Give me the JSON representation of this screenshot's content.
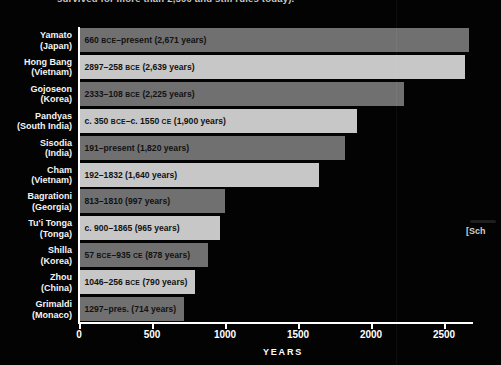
{
  "caption": {
    "fragment": "survived for more than 2,500 and still rules today)."
  },
  "side_text": {
    "fragment": "[Sch"
  },
  "colors": {
    "background": "#030303",
    "bar_dark": "#707070",
    "bar_light": "#c7c7c7",
    "axis": "#ffffff",
    "axis_label_text": "#ffffff",
    "category_label_text": "#f4f4f4",
    "bar_label_text": "#121212"
  },
  "chart_data": {
    "type": "bar",
    "orientation": "horizontal",
    "title": "",
    "xlabel": "YEARS",
    "ylabel": "",
    "x_ticks": [
      0,
      500,
      1000,
      1500,
      2000,
      2500
    ],
    "xlim": [
      0,
      2770
    ],
    "grid": false,
    "legend": "none",
    "bars": [
      {
        "dynasty": "Yamato",
        "country": "(Japan)",
        "label": "660 BCE–present (2,671 years)",
        "years": 2671,
        "shade": "dark"
      },
      {
        "dynasty": "Hong Bang",
        "country": "(Vietnam)",
        "label": "2897–258 BCE (2,639 years)",
        "years": 2639,
        "shade": "light"
      },
      {
        "dynasty": "Gojoseon",
        "country": "(Korea)",
        "label": "2333–108 BCE (2,225 years)",
        "years": 2225,
        "shade": "dark"
      },
      {
        "dynasty": "Pandyas",
        "country": "(South India)",
        "label": "c. 350 BCE–c. 1550 CE (1,900 years)",
        "years": 1900,
        "shade": "light"
      },
      {
        "dynasty": "Sisodia",
        "country": "(India)",
        "label": "191–present (1,820 years)",
        "years": 1820,
        "shade": "dark"
      },
      {
        "dynasty": "Cham",
        "country": "(Vietnam)",
        "label": "192–1832 (1,640 years)",
        "years": 1640,
        "shade": "light"
      },
      {
        "dynasty": "Bagrationi",
        "country": "(Georgia)",
        "label": "813–1810 (997 years)",
        "years": 997,
        "shade": "dark"
      },
      {
        "dynasty": "Tu'i Tonga",
        "country": "(Tonga)",
        "label": "c. 900–1865 (965 years)",
        "years": 965,
        "shade": "light"
      },
      {
        "dynasty": "Shilla",
        "country": "(Korea)",
        "label": "57 BCE–935 CE (878 years)",
        "years": 878,
        "shade": "dark"
      },
      {
        "dynasty": "Zhou",
        "country": "(China)",
        "label": "1046–256 BCE (790 years)",
        "years": 790,
        "shade": "light"
      },
      {
        "dynasty": "Grimaldi",
        "country": "(Monaco)",
        "label": "1297–pres. (714 years)",
        "years": 714,
        "shade": "dark"
      }
    ]
  }
}
